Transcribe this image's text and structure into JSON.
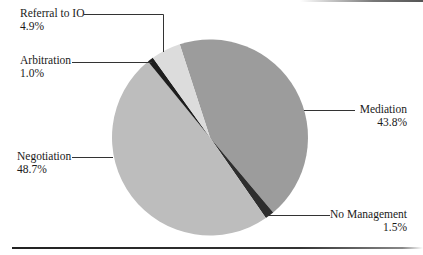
{
  "chart_data": {
    "type": "pie",
    "title": "",
    "slices": [
      {
        "label": "Mediation",
        "value": 43.8,
        "display": "43.8%",
        "color": "#9c9c9c"
      },
      {
        "label": "No Management",
        "value": 1.5,
        "display": "1.5%",
        "color": "#2e2e2e"
      },
      {
        "label": "Negotiation",
        "value": 48.7,
        "display": "48.7%",
        "color": "#bdbdbd"
      },
      {
        "label": "Arbitration",
        "value": 1.0,
        "display": "1.0%",
        "color": "#1e1e1e"
      },
      {
        "label": "Referral to IO",
        "value": 4.9,
        "display": "4.9%",
        "color": "#dcdcdc"
      }
    ],
    "start_angle_deg": -18,
    "direction": "clockwise",
    "legend": "none (leader-line labels)",
    "units": "%"
  },
  "labels": {
    "referral": {
      "name": "Referral to IO",
      "pct": "4.9%"
    },
    "arbitration": {
      "name": "Arbitration",
      "pct": "1.0%"
    },
    "negotiation": {
      "name": "Negotiation",
      "pct": "48.7%"
    },
    "mediation": {
      "name": "Mediation",
      "pct": "43.8%"
    },
    "no_management": {
      "name": "No Management",
      "pct": "1.5%"
    }
  }
}
